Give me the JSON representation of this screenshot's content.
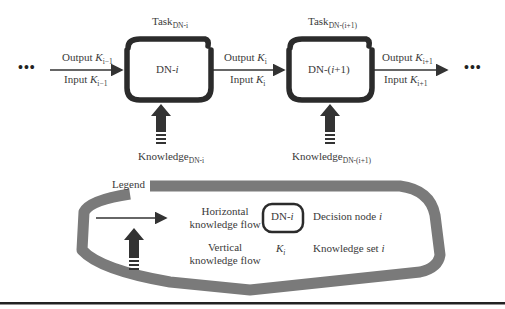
{
  "diagram": {
    "type": "decision-node-knowledge-flow",
    "colors": {
      "node_border": "#2b2b2b",
      "legend_border": "#7a7a7a",
      "arrow": "#333333",
      "divider": "#222222"
    },
    "ellipsis_left": "•••",
    "ellipsis_right": "•••",
    "nodes": [
      {
        "id": "DN-i",
        "label_main": "DN-",
        "label_var": "i",
        "task_main": "Task",
        "task_sub": "DN-i",
        "knowledge_main": "Knowledge",
        "knowledge_sub": "DN-i"
      },
      {
        "id": "DN-(i+1)",
        "label_main": "DN-(",
        "label_var": "i",
        "label_end": "+1)",
        "task_main": "Task",
        "task_sub": "DN-(i+1)",
        "knowledge_main": "Knowledge",
        "knowledge_sub": "DN-(i+1)"
      }
    ],
    "edges": [
      {
        "output_label": "Output ",
        "output_var": "K",
        "output_sub": "i−1",
        "input_label": "Input ",
        "input_var": "K",
        "input_sub": "i−1"
      },
      {
        "output_label": "Output ",
        "output_var": "K",
        "output_sub": "i",
        "input_label": "Input ",
        "input_var": "K",
        "input_sub": "i"
      },
      {
        "output_label": "Output ",
        "output_var": "K",
        "output_sub": "i+1",
        "input_label": "Input ",
        "input_var": "K",
        "input_sub": "i+1"
      }
    ],
    "legend": {
      "title": "Legend",
      "horizontal_line1": "Horizontal",
      "horizontal_line2": "knowledge flow",
      "vertical_line1": "Vertical",
      "vertical_line2": "knowledge flow",
      "node_symbol_main": "DN-",
      "node_symbol_var": "i",
      "node_desc_main": "Decision node ",
      "node_desc_var": "i",
      "kset_symbol_var": "K",
      "kset_symbol_sub": "i",
      "kset_desc_main": "Knowledge set ",
      "kset_desc_var": "i"
    }
  }
}
